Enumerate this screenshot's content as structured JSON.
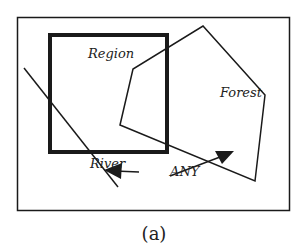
{
  "diagram": {
    "labels": {
      "region": "Region",
      "forest": "Forest",
      "river": "River",
      "any": "ANY"
    },
    "caption": "(a)",
    "colors": {
      "stroke": "#1a1a1a",
      "background": "#ffffff"
    }
  }
}
